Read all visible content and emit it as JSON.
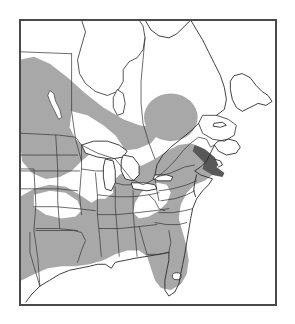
{
  "figure": {
    "kind": "distribution-map",
    "title": "",
    "region": "Eastern North America",
    "frame": {
      "left": 19,
      "top": 19,
      "width": 258,
      "height": 287,
      "border_color": "#4a4a4a",
      "background_color": "#ffffff"
    }
  },
  "colors": {
    "range_shading": "#a8a8a8",
    "dark_shading": "#585858",
    "coastline": "#2b2b2b",
    "political_border": "#3c3c3c",
    "water": "#ffffff",
    "land": "#ffffff",
    "page_background": "#ffffff"
  },
  "legend": {
    "present": false,
    "entries": [
      {
        "label": "Shaded range",
        "color": "#a8a8a8"
      },
      {
        "label": "Unshaded (absent)",
        "color": "#ffffff"
      }
    ]
  },
  "map_features": {
    "water_bodies": [
      "Hudson Bay",
      "James Bay",
      "Gulf of St. Lawrence",
      "Lake Superior",
      "Lake Michigan",
      "Lake Huron",
      "Lake Erie",
      "Lake Ontario",
      "Lake Winnipeg",
      "Lake Okeechobee",
      "Atlantic Ocean",
      "Gulf of Mexico"
    ],
    "canadian_provinces": [
      "Manitoba",
      "Ontario",
      "Quebec",
      "New Brunswick",
      "Nova Scotia",
      "Prince Edward Island",
      "Newfoundland"
    ],
    "us_states_shaded": [
      "Texas",
      "Oklahoma",
      "Arkansas",
      "Louisiana",
      "Mississippi",
      "Alabama",
      "Georgia",
      "Florida",
      "South Carolina",
      "North Carolina",
      "Tennessee",
      "Kentucky",
      "Indiana",
      "Ohio",
      "Illinois",
      "Virginia",
      "Maryland",
      "Delaware",
      "New Jersey"
    ],
    "us_states_unshaded": [
      "North Dakota",
      "South Dakota",
      "Nebraska",
      "Kansas",
      "Iowa",
      "Minnesota",
      "Wisconsin",
      "Michigan",
      "Missouri",
      "West Virginia",
      "Pennsylvania",
      "New York",
      "Vermont",
      "New Hampshire",
      "Maine",
      "Massachusetts",
      "Connecticut",
      "Rhode Island"
    ],
    "shaded_patches": [
      "Northwestern patch across Manitoba and western Ontario",
      "Isolated patch in central Quebec",
      "Continuous southeastern patch from Texas to the Atlantic coast",
      "Dark coastal strip along the mid-Atlantic shoreline"
    ]
  }
}
